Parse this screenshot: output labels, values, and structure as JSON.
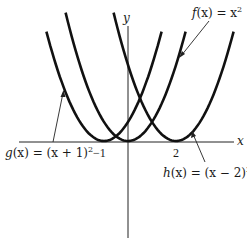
{
  "chart_data": {
    "type": "line",
    "title": "",
    "xlabel": "x",
    "ylabel": "y",
    "grid": false,
    "x_ticks": [
      {
        "value": -1,
        "label": "−1"
      },
      {
        "value": 2,
        "label": "2"
      }
    ],
    "series": [
      {
        "name": "f(x) = x²",
        "expr": "x^2",
        "vertex": [
          0,
          0
        ],
        "x_range": [
          -2.6,
          2.4
        ]
      },
      {
        "name": "g(x) = (x + 1)²",
        "expr": "(x+1)^2",
        "vertex": [
          -1,
          0
        ],
        "x_range": [
          -3.4,
          1.4
        ]
      },
      {
        "name": "h(x) = (x − 2)²",
        "expr": "(x-2)^2",
        "vertex": [
          2,
          0
        ],
        "x_range": [
          -0.6,
          4.4
        ]
      }
    ],
    "annotations": [
      {
        "text": "f(x) = x²",
        "points_to": "f"
      },
      {
        "text": "g(x) = (x + 1)²",
        "points_to": "g"
      },
      {
        "text": "h(x) = (x − 2)²",
        "points_to": "h"
      }
    ]
  },
  "labels": {
    "x_axis": "x",
    "y_axis": "y",
    "tick_neg1": "−1",
    "tick_2": "2",
    "f_name": "f",
    "f_rest": "(x) = x",
    "f_exp": "2",
    "g_name": "g",
    "g_rest": "(x) = (x + 1)",
    "g_exp": "2",
    "h_name": "h",
    "h_rest": "(x) = (x − 2)",
    "h_exp": "2"
  }
}
